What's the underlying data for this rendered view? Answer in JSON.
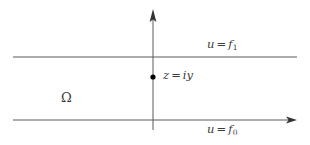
{
  "figure": {
    "width": 310,
    "height": 145,
    "background": "#ffffff",
    "line_color": "#5a5a5a",
    "axis_color": "#5a5a5a",
    "text_color": "#3b3b3b",
    "point_color": "#000000"
  },
  "labels": {
    "upper_boundary": {
      "variable": "u",
      "operator": "=",
      "function": "f",
      "subscript": "1"
    },
    "lower_boundary": {
      "variable": "u",
      "operator": "=",
      "function": "f",
      "subscript": "0"
    },
    "point": {
      "variable": "z",
      "operator": "=",
      "value": "iy"
    },
    "domain": {
      "symbol": "Ω"
    }
  },
  "geometry": {
    "upper_line": {
      "x1": 13,
      "y1": 57,
      "x2": 297,
      "y2": 57
    },
    "lower_line": {
      "x1": 13,
      "y1": 120,
      "x2": 289,
      "y2": 120
    },
    "vertical_axis": {
      "x": 153,
      "y_top": 14,
      "y_bottom": 130
    },
    "point_marker": {
      "x": 153,
      "y": 77,
      "radius": 2.6
    }
  }
}
